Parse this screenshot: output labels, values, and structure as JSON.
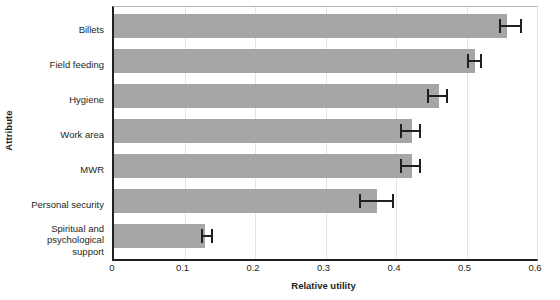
{
  "chart_data": {
    "type": "bar",
    "orientation": "horizontal",
    "title": "",
    "xlabel": "Relative utility",
    "ylabel": "Attribute",
    "categories": [
      "Billets",
      "Field feeding",
      "Hygiene",
      "Work area",
      "MWR",
      "Personal security",
      "Spiritual and psychological support"
    ],
    "category_lines": [
      [
        "Billets"
      ],
      [
        "Field feeding"
      ],
      [
        "Hygiene"
      ],
      [
        "Work area"
      ],
      [
        "MWR"
      ],
      [
        "Personal security"
      ],
      [
        "Spiritual and",
        "psychological",
        "support"
      ]
    ],
    "values": [
      0.557,
      0.512,
      0.461,
      0.423,
      0.423,
      0.373,
      0.129
    ],
    "error_low": [
      0.546,
      0.5,
      0.444,
      0.405,
      0.405,
      0.348,
      0.123
    ],
    "error_high": [
      0.579,
      0.522,
      0.474,
      0.435,
      0.435,
      0.397,
      0.14
    ],
    "xlim": [
      0,
      0.6
    ],
    "xticks": [
      0,
      0.1,
      0.2,
      0.3,
      0.4,
      0.5,
      0.6
    ],
    "xtick_labels": [
      "0",
      "0.1",
      "0.2",
      "0.3",
      "0.4",
      "0.5",
      "0.6"
    ],
    "grid": "vertical",
    "legend": null,
    "bar_color": "#a6a6a6",
    "error_color": "#231f20",
    "axis_color": "#231f20",
    "grid_color": "#e3e3e3",
    "background_color": "#ffffff"
  }
}
